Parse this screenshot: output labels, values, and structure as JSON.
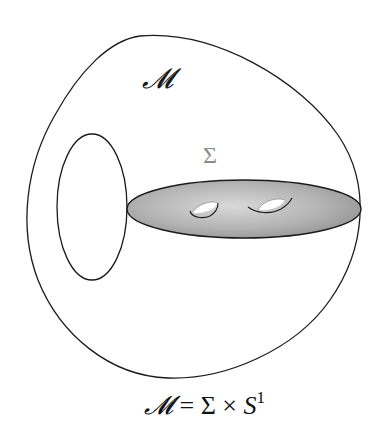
{
  "figure": {
    "labels": {
      "manifold": "𝓜",
      "surface": "Σ"
    },
    "caption": {
      "lhs": "𝓜",
      "equals": " = ",
      "factor1": "Σ",
      "times": " × ",
      "factor2": "S",
      "exponent": "1"
    },
    "colors": {
      "stroke": "#1a1a1a",
      "disc_fill_light": "#e6e6e6",
      "disc_fill_dark": "#8c8c8c",
      "sigma_label": "#8a8a8a",
      "background": "#ffffff"
    },
    "elements": [
      {
        "name": "outer-manifold-boundary",
        "shape": "closed curve"
      },
      {
        "name": "circle-fiber",
        "shape": "ellipse"
      },
      {
        "name": "surface-disc",
        "shape": "shaded ellipse",
        "genus": 2
      },
      {
        "name": "handle-hole-1",
        "shape": "hole"
      },
      {
        "name": "handle-hole-2",
        "shape": "hole"
      }
    ]
  }
}
